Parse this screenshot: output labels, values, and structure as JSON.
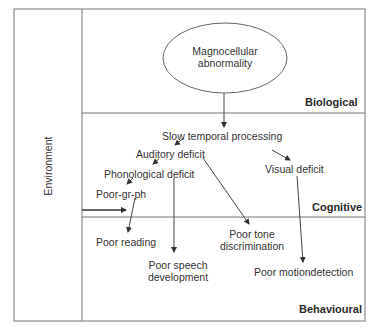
{
  "diagram": {
    "environment_label": "Environment",
    "layers": {
      "biological": "Biological",
      "cognitive": "Cognitive",
      "behavioural": "Behavioural"
    },
    "nodes": {
      "magnocellular_line1": "Magnocellular",
      "magnocellular_line2": "abnormality",
      "slow_temporal": "Slow temporal processing",
      "auditory_deficit": "Auditory deficit",
      "visual_deficit": "Visual deficit",
      "phonological_deficit": "Phonological deficit",
      "poor_gr_ph": "Poor-gr-ph",
      "poor_reading": "Poor reading",
      "poor_speech_line1": "Poor speech",
      "poor_speech_line2": "development",
      "poor_tone_line1": "Poor tone",
      "poor_tone_line2": "discrimination",
      "poor_motion": "Poor motiondetection"
    },
    "edges": [
      {
        "from": "Magnocellular abnormality",
        "to": "Slow temporal processing"
      },
      {
        "from": "Slow temporal processing",
        "to": "Auditory deficit"
      },
      {
        "from": "Slow temporal processing",
        "to": "Visual deficit"
      },
      {
        "from": "Auditory deficit",
        "to": "Phonological deficit"
      },
      {
        "from": "Auditory deficit",
        "to": "Poor tone discrimination"
      },
      {
        "from": "Phonological deficit",
        "to": "Poor-gr-ph"
      },
      {
        "from": "Phonological deficit",
        "to": "Poor speech development"
      },
      {
        "from": "Poor-gr-ph",
        "to": "Poor reading"
      },
      {
        "from": "Visual deficit",
        "to": "Poor motiondetection"
      },
      {
        "from": "Environment",
        "to": "Cognitive"
      }
    ],
    "colors": {
      "line": "#555555",
      "text": "#333333",
      "background": "#ffffff"
    }
  }
}
